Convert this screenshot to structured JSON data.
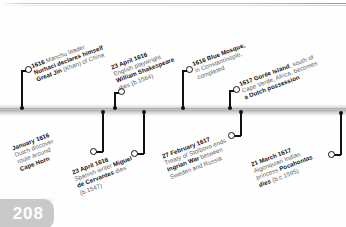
{
  "page": {
    "number": "208",
    "accent_gray": "#c9c9c9",
    "bar_color": "#b4b4b4",
    "ink_color": "#111111",
    "muted_color": "#5f5f5f"
  },
  "timeline": {
    "orientation": "horizontal",
    "events_above": [
      {
        "id": "manchu-nurhaci",
        "date": "1616",
        "lines": [
          {
            "bold": "1616 ",
            "plain": "Manchu leader"
          },
          {
            "bold": "Nurhaci declares himself",
            "plain": ""
          },
          {
            "bold": "Great Jin ",
            "plain": "(Khan) of China"
          }
        ],
        "marker_x": 22,
        "ring_x": 28,
        "ring_y": 66
      },
      {
        "id": "shakespeare-dies",
        "date": "23 April 1616",
        "lines": [
          {
            "bold": "23 April 1616",
            "plain": ""
          },
          {
            "bold": "",
            "plain": "English playwright"
          },
          {
            "bold": "William Shakespeare",
            "plain": ""
          },
          {
            "bold": "",
            "plain": "dies (b.1564)"
          }
        ],
        "marker_x": 115,
        "ring_x": 121,
        "ring_y": 88
      },
      {
        "id": "blue-mosque",
        "date": "1616",
        "lines": [
          {
            "bold": "1616 Blue Mosque,",
            "plain": ""
          },
          {
            "bold": "",
            "plain": "in Constantinople,"
          },
          {
            "bold": "",
            "plain": "completed"
          }
        ],
        "marker_x": 183,
        "ring_x": 189,
        "ring_y": 66
      },
      {
        "id": "goree-island",
        "date": "1617",
        "lines": [
          {
            "bold": "1617 Gorée Island",
            "plain": ", south of"
          },
          {
            "bold": "",
            "plain": "Cape Verde, Africa, becomes"
          },
          {
            "bold": "a Dutch possession",
            "plain": ""
          }
        ],
        "marker_x": 230,
        "ring_x": 236,
        "ring_y": 86
      }
    ],
    "events_below": [
      {
        "id": "cape-horn",
        "date": "January 1616",
        "lines": [
          {
            "bold": "January 1616",
            "plain": ""
          },
          {
            "bold": "",
            "plain": "Dutch discover"
          },
          {
            "bold": "",
            "plain": "route around"
          },
          {
            "bold": "Cape Horn",
            "plain": ""
          }
        ],
        "marker_x": 103,
        "ring_x": 93,
        "ring_y": 150
      },
      {
        "id": "cervantes-dies",
        "date": "23 April 1616",
        "lines": [
          {
            "bold": "23 April 1616",
            "plain": ""
          },
          {
            "bold": "",
            "plain": "Spanish writer "
          },
          {
            "bold": "Miguel",
            "plain": ""
          },
          {
            "bold": "de Cervantes ",
            "plain": "dies"
          },
          {
            "bold": "",
            "plain": "(b.1547)"
          }
        ],
        "marker_x": 144,
        "ring_x": 134,
        "ring_y": 152
      },
      {
        "id": "treaty-stolbovo",
        "date": "27 February 1617",
        "lines": [
          {
            "bold": "27 February 1617",
            "plain": ""
          },
          {
            "bold": "",
            "plain": "Treaty of Stolbovo ends"
          },
          {
            "bold": "Ingrian War ",
            "plain": "between"
          },
          {
            "bold": "",
            "plain": "Sweden and Russia"
          }
        ],
        "marker_x": 241,
        "ring_x": 231,
        "ring_y": 134
      },
      {
        "id": "pocahontas-dies",
        "date": "21 March 1617",
        "lines": [
          {
            "bold": "21 March 1617",
            "plain": ""
          },
          {
            "bold": "",
            "plain": "Algonquian Indian"
          },
          {
            "bold": "",
            "plain": "princess "
          },
          {
            "bold": "Pocahontas",
            "plain": ""
          },
          {
            "bold": "dies ",
            "plain": "(b.c.1595)"
          }
        ],
        "marker_x": 341,
        "ring_x": 331,
        "ring_y": 152
      }
    ],
    "captions": {
      "manchu-nurhaci": "1616 Manchu leader\nNurhaci declares himself\nGreat Jin (Khan) of China",
      "shakespeare-dies": "23 April 1616\nEnglish playwright\nWilliam Shakespeare\ndies (b.1564)",
      "blue-mosque": "1616 Blue Mosque,\nin Constantinople,\ncompleted",
      "goree-island": "1617 Gorée Island, south of\nCape Verde, Africa, becomes\na Dutch possession",
      "cape-horn": "January 1616\nDutch discover\nroute around\nCape Horn",
      "cervantes-dies": "23 April 1616\nSpanish writer Miguel\nde Cervantes dies\n(b.1547)",
      "treaty-stolbovo": "27 February 1617\nTreaty of Stolbovo ends\nIngrian War between\nSweden and Russia",
      "pocahontas-dies": "21 March 1617\nAlgonquian Indian\nprincess Pocahontas\ndies (b.c.1595)"
    }
  }
}
